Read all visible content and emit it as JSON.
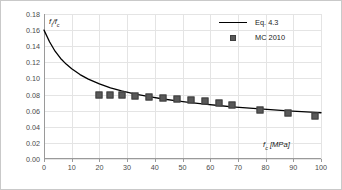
{
  "chart_data": {
    "type": "scatter",
    "title": "",
    "xlabel": "f_c [MPa]",
    "ylabel": "f_t/f_c",
    "xlim": [
      0,
      100
    ],
    "ylim": [
      0.0,
      0.18
    ],
    "grid": true,
    "legend_position": "top-right",
    "xticks": [
      "0",
      "10",
      "20",
      "30",
      "40",
      "50",
      "60",
      "70",
      "80",
      "90",
      "100"
    ],
    "xtick_values": [
      0,
      10,
      20,
      30,
      40,
      50,
      60,
      70,
      80,
      90,
      100
    ],
    "yticks": [
      "0.00",
      "0.02",
      "0.04",
      "0.06",
      "0.08",
      "0.10",
      "0.12",
      "0.14",
      "0.16",
      "0.18"
    ],
    "ytick_values": [
      0.0,
      0.02,
      0.04,
      0.06,
      0.08,
      0.1,
      0.12,
      0.14,
      0.16,
      0.18
    ],
    "series": [
      {
        "name": "Eq. 4.3",
        "type": "line",
        "color": "#000000",
        "x": [
          0,
          2,
          4,
          6,
          8,
          10,
          13,
          16,
          20,
          24,
          28,
          33,
          38,
          43,
          48,
          53,
          58,
          63,
          68,
          73,
          78,
          83,
          88,
          93,
          98,
          100
        ],
        "y": [
          0.16,
          0.1455,
          0.1338,
          0.1248,
          0.1178,
          0.112,
          0.1048,
          0.0992,
          0.0932,
          0.0884,
          0.0846,
          0.0806,
          0.0773,
          0.0745,
          0.0721,
          0.07,
          0.0681,
          0.0664,
          0.0648,
          0.0634,
          0.0621,
          0.0609,
          0.0598,
          0.0588,
          0.0578,
          0.0574
        ]
      },
      {
        "name": "MC 2010",
        "type": "scatter",
        "color": "#595959",
        "x": [
          20,
          24,
          28,
          33,
          38,
          43,
          48,
          53,
          58,
          63,
          68,
          78,
          88,
          98
        ],
        "y": [
          0.079,
          0.0795,
          0.079,
          0.0785,
          0.0765,
          0.0758,
          0.0742,
          0.0727,
          0.0716,
          0.069,
          0.0668,
          0.061,
          0.0572,
          0.0528
        ]
      }
    ],
    "legend": [
      {
        "label": "Eq. 4.3",
        "key": "line",
        "color": "#000000"
      },
      {
        "label": "MC 2010",
        "key": "square",
        "color": "#595959"
      }
    ]
  },
  "axes": {
    "y_title_main": "f",
    "y_title_sub1": "t",
    "y_title_slash": "/f",
    "y_title_sub2": "c",
    "x_title_main": "f",
    "x_title_sub": "c",
    "x_title_unit": " [MPa]"
  },
  "colors": {
    "line": "#000000",
    "marker_fill": "#595959",
    "marker_edge": "#3f3f3f",
    "grid": "#e4e4e4",
    "axis": "#9a9a9a",
    "border": "#c9c9c9",
    "tick_text": "#4a4a4a"
  }
}
